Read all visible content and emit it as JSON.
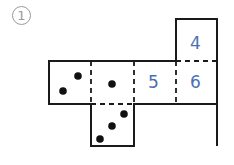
{
  "label": "1",
  "faces": {
    "top": {
      "number": "4"
    },
    "row": [
      {
        "type": "dots",
        "count": 2
      },
      {
        "type": "dots",
        "count": 1
      },
      {
        "type": "number",
        "number": "5"
      },
      {
        "type": "number",
        "number": "6"
      }
    ],
    "bottom": {
      "type": "dots",
      "count": 3
    }
  },
  "colors": {
    "line": "#1a1a1a",
    "number": "#4a6fb5",
    "label": "#9a9a9a"
  }
}
